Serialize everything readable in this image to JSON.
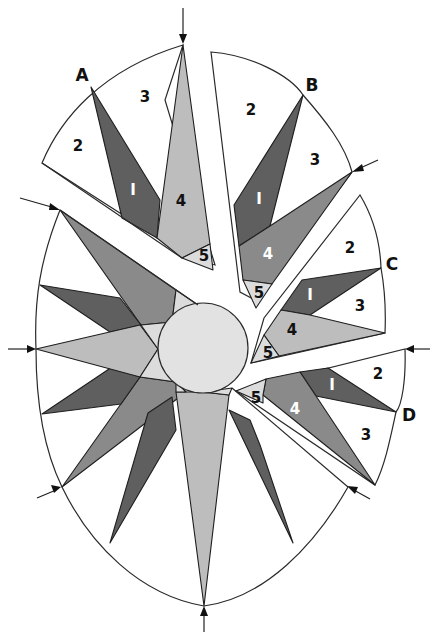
{
  "diagram": {
    "colors": {
      "background": "#ffffff",
      "white_piece": "#ffffff",
      "dark_gray": "#5f5f5f",
      "medium_gray": "#8a8a8a",
      "light_gray": "#bdbdbd",
      "lightest_gray": "#dcdcdc",
      "center_circle": "#e2e2e2",
      "outline": "#1e1e1e"
    },
    "segment_letters": {
      "A": "A",
      "B": "B",
      "C": "C",
      "D": "D"
    },
    "piece_labels": {
      "p1": "I",
      "p2": "2",
      "p3": "3",
      "p4": "4",
      "p5": "5"
    },
    "segments": [
      {
        "letter": "A",
        "pieces": [
          "2",
          "3",
          "I",
          "4",
          "5"
        ]
      },
      {
        "letter": "B",
        "pieces": [
          "2",
          "3",
          "I",
          "4",
          "5"
        ]
      },
      {
        "letter": "C",
        "pieces": [
          "2",
          "3",
          "I",
          "4",
          "5"
        ]
      },
      {
        "letter": "D",
        "pieces": [
          "2",
          "3",
          "I",
          "4",
          "5"
        ]
      }
    ],
    "arrows": [
      "top",
      "upper-right",
      "right",
      "lower-right",
      "bottom",
      "lower-left",
      "left",
      "upper-left"
    ]
  }
}
